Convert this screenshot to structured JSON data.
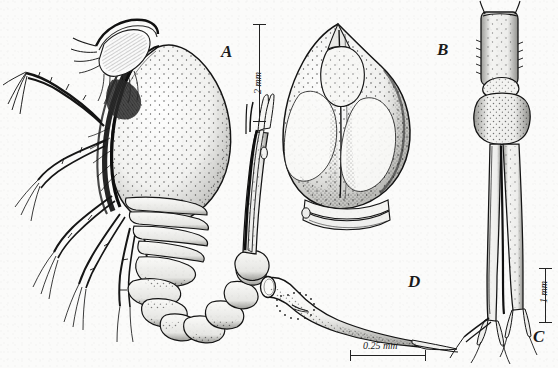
{
  "plate": {
    "title": "Crustacean morphology plate",
    "medium": "pen-and-ink stipple line drawing",
    "background_color": "#fbfbfa",
    "ink_color": "#1a1a1a",
    "width": 558,
    "height": 368
  },
  "panels": [
    {
      "id": "A",
      "label": "A",
      "description": "Whole animal in lateral view: ovoid stippled carapace, head with antennae and setae, thoracic legs, curved segmented pleon, and detached uropod/telson at right"
    },
    {
      "id": "B",
      "label": "B",
      "description": "Carapace in dorsal view: rounded shield with pointed anterior rostrum, paired dorsal lobes, dense stippling and basal rim"
    },
    {
      "id": "C",
      "label": "C",
      "description": "Elongate segmented appendage, telson and uropodal rami with terminal setae"
    },
    {
      "id": "D",
      "label": "D",
      "description": "Funnel- or trumpet-shaped appendage tapering to an attenuate tip with inner dotted outline"
    }
  ],
  "scale_bars": [
    {
      "id": "scale-a",
      "label": "2 mm",
      "orientation": "vertical",
      "panel": "A"
    },
    {
      "id": "scale-c",
      "label": "1 mm",
      "orientation": "vertical",
      "panel": "C"
    },
    {
      "id": "scale-d",
      "label": "0.25 mm",
      "orientation": "horizontal",
      "panel": "D"
    }
  ]
}
